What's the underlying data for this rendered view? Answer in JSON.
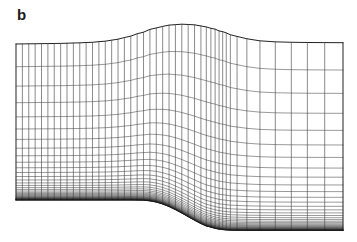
{
  "figure": {
    "panel_label": "b",
    "caption_text": "",
    "kind": "computational-grid",
    "background_color": "#ffffff",
    "line_color": "#1f1f1f",
    "label_color": "#1a1a1a"
  },
  "chart_data": {
    "type": "mesh",
    "title": "b",
    "xlabel": "",
    "ylabel": "",
    "grid": true,
    "legend": null,
    "xlim": [
      16,
      343
    ],
    "ylim": [
      22,
      232
    ],
    "topology": {
      "i_lines": 45,
      "j_lines": 41,
      "i_label": "streamwise grid lines",
      "j_label": "wall-normal grid lines"
    },
    "boundaries": {
      "top": {
        "name": "upper-boundary",
        "points": [
          [
            16,
            44.0
          ],
          [
            30,
            43.8
          ],
          [
            45,
            43.6
          ],
          [
            60,
            43.4
          ],
          [
            75,
            43.0
          ],
          [
            90,
            42.4
          ],
          [
            105,
            41.2
          ],
          [
            118,
            39.2
          ],
          [
            130,
            36.2
          ],
          [
            142,
            32.4
          ],
          [
            152,
            29.0
          ],
          [
            162,
            26.4
          ],
          [
            172,
            24.8
          ],
          [
            182,
            24.2
          ],
          [
            192,
            24.6
          ],
          [
            202,
            26.0
          ],
          [
            212,
            28.4
          ],
          [
            222,
            31.6
          ],
          [
            232,
            35.0
          ],
          [
            242,
            37.8
          ],
          [
            252,
            39.8
          ],
          [
            264,
            41.2
          ],
          [
            278,
            41.9
          ],
          [
            294,
            42.3
          ],
          [
            310,
            42.5
          ],
          [
            326,
            42.6
          ],
          [
            343,
            42.7
          ]
        ]
      },
      "bottom": {
        "name": "lower-boundary",
        "points": [
          [
            16,
            200.0
          ],
          [
            36,
            200.0
          ],
          [
            56,
            200.0
          ],
          [
            76,
            200.0
          ],
          [
            96,
            200.0
          ],
          [
            116,
            200.0
          ],
          [
            132,
            200.0
          ],
          [
            144,
            200.2
          ],
          [
            152,
            201.0
          ],
          [
            159,
            202.6
          ],
          [
            166,
            205.2
          ],
          [
            173,
            208.6
          ],
          [
            180,
            212.4
          ],
          [
            187,
            216.4
          ],
          [
            194,
            220.2
          ],
          [
            201,
            223.6
          ],
          [
            208,
            226.4
          ],
          [
            215,
            228.4
          ],
          [
            222,
            229.6
          ],
          [
            230,
            230.2
          ],
          [
            245,
            230.4
          ],
          [
            262,
            230.4
          ],
          [
            280,
            230.4
          ],
          [
            300,
            230.4
          ],
          [
            322,
            230.4
          ],
          [
            343,
            230.4
          ]
        ]
      },
      "left": {
        "name": "inlet-boundary",
        "x": 16,
        "y_top": 44.0,
        "y_bottom": 200.0
      },
      "right": {
        "name": "outlet-boundary",
        "x": 343,
        "y_top": 42.7,
        "y_bottom": 230.4
      }
    },
    "streamwise_stations": [
      0.0,
      0.0195,
      0.039,
      0.0585,
      0.078,
      0.0975,
      0.117,
      0.1365,
      0.156,
      0.1755,
      0.195,
      0.2145,
      0.234,
      0.2535,
      0.273,
      0.2925,
      0.312,
      0.3315,
      0.351,
      0.3705,
      0.39,
      0.4095,
      0.429,
      0.4485,
      0.468,
      0.4875,
      0.507,
      0.5265,
      0.546,
      0.5655,
      0.582,
      0.596,
      0.609,
      0.621,
      0.632,
      0.643,
      0.6555,
      0.676,
      0.706,
      0.746,
      0.793,
      0.842,
      0.891,
      0.944,
      1.0
    ],
    "wall_normal_clustering": {
      "law": "geometric-stretching-toward-lower-wall",
      "stretch_ratio": 1.17,
      "first_cell_fraction": 0.0035,
      "note": "Horizontal grid lines bunch strongly near the bottom wall and are widely spaced near the top boundary"
    }
  }
}
